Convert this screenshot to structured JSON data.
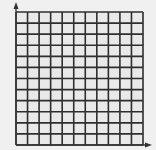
{
  "chart_data": {
    "type": "scatter",
    "title": "",
    "xlabel": "",
    "ylabel": "",
    "x": [],
    "y": [],
    "series": [],
    "grid": true,
    "grid_columns": 11,
    "grid_rows": 12,
    "x_ticks": [],
    "y_ticks": [],
    "axes_arrows": true,
    "legend": null
  },
  "colors": {
    "background": "#f0f0f0",
    "grid_fill": "#e9e9e9",
    "grid_line": "#2e2e2e",
    "axis": "#333333"
  },
  "layout": {
    "origin_x": 16,
    "origin_y": 145,
    "grid_left": 16,
    "grid_top": 12,
    "grid_right": 143,
    "grid_bottom": 145,
    "x_arrow_end": 152,
    "y_arrow_end": 2
  }
}
